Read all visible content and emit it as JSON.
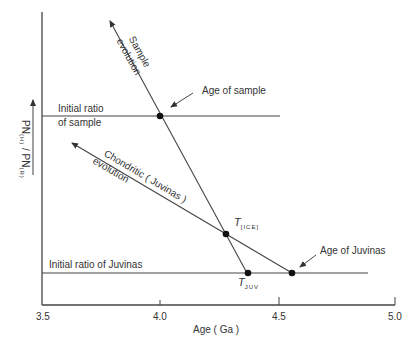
{
  "diagram": {
    "type": "isochron-evolution",
    "x_axis": {
      "label": "Age ( Ga )",
      "ticks": [
        "3.5",
        "4.0",
        "4.5",
        "5.0"
      ]
    },
    "y_axis": {
      "label_main": "PN",
      "label_sub1": "(H)",
      "label_sep": " / PN",
      "label_sub2": "(R)"
    },
    "lines": {
      "sample_evolution_line1": "Sample",
      "sample_evolution_line2": "evolution",
      "chondritic_line1": "Chondritic  ( Juvinas )",
      "chondritic_line2": "evolution"
    },
    "labels": {
      "initial_ratio_sample_line1": "Initial ratio",
      "initial_ratio_sample_line2": "of sample",
      "initial_ratio_juvinas": "Initial ratio of Juvinas",
      "age_of_sample": "Age of sample",
      "age_of_juvinas": "Age of Juvinas",
      "t_ice_main": "T",
      "t_ice_sub": "[ICE]",
      "t_juv_main": "T",
      "t_juv_sub": "JUV"
    },
    "colors": {
      "line": "#444444",
      "text": "#333333",
      "point": "#111111"
    }
  }
}
